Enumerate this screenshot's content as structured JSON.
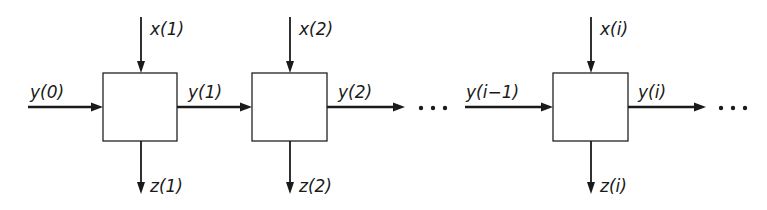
{
  "diagram": {
    "type": "systolic-array-pipeline",
    "colors": {
      "ink": "#1a1a1a",
      "background": "#ffffff"
    },
    "input": {
      "label": "y(0)"
    },
    "cells": [
      {
        "top_input": "x(1)",
        "right_output": "y(1)",
        "bottom_output": "z(1)"
      },
      {
        "top_input": "x(2)",
        "right_output": "y(2)",
        "bottom_output": "z(2)"
      },
      {
        "left_input": "y(i−1)",
        "top_input": "x(i)",
        "right_output": "y(i)",
        "bottom_output": "z(i)"
      }
    ],
    "ellipsis": [
      "···",
      "···"
    ]
  }
}
